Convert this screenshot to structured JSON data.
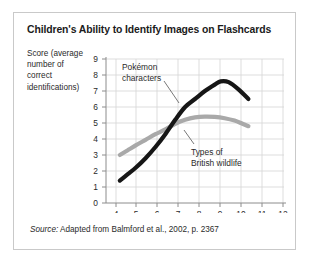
{
  "figure": {
    "title": "Children's Ability to Identify Images on Flashcards",
    "y_axis_title": "Score (average number of correct identifications)",
    "source_label": "Source:",
    "source_text": " Adapted from Balmford et al., 2002, p. 2367"
  },
  "colors": {
    "pokemon_line": "#161616",
    "wildlife_line": "#a9a9a9",
    "grid": "#d4d4d4",
    "axis": "#8c8c8c",
    "text": "#2a2a2a",
    "title_text": "#1b1b1b",
    "card_border": "#c9c9c9",
    "background": "#ffffff"
  },
  "chart_data": {
    "type": "line",
    "title": "Children's Ability to Identify Images on Flashcards",
    "xlabel": "Age (in years)",
    "ylabel": "Score (average number of correct identifications)",
    "xlim": [
      3.5,
      12.5
    ],
    "ylim": [
      0,
      9
    ],
    "xticks": [
      4,
      5,
      6,
      7,
      8,
      9,
      10,
      11,
      12
    ],
    "yticks": [
      0,
      1,
      2,
      3,
      4,
      5,
      6,
      7,
      8,
      9
    ],
    "xtick_labels": [
      "4",
      "5",
      "6",
      "7",
      "8",
      "9",
      "10",
      "11",
      "12"
    ],
    "ytick_labels": [
      "0",
      "1",
      "2",
      "3",
      "4",
      "5",
      "6",
      "7",
      "8",
      "9"
    ],
    "grid": true,
    "legend": "annotations",
    "series": [
      {
        "name": "Pokémon characters",
        "color": "#161616",
        "x": [
          4.2,
          4.6,
          5.0,
          5.5,
          6.0,
          6.5,
          7.0,
          7.5,
          8.0,
          8.5,
          9.0,
          9.3,
          9.7,
          10.2,
          10.7
        ],
        "y": [
          1.4,
          1.8,
          2.2,
          2.8,
          3.5,
          4.3,
          5.2,
          6.0,
          6.5,
          7.0,
          7.4,
          7.6,
          7.55,
          7.1,
          6.5
        ]
      },
      {
        "name": "Types of British wildlife",
        "color": "#a9a9a9",
        "x": [
          4.2,
          4.6,
          5.0,
          5.5,
          6.0,
          6.5,
          7.0,
          7.5,
          8.0,
          8.5,
          9.0,
          9.5,
          10.0,
          10.4,
          10.7
        ],
        "y": [
          3.0,
          3.3,
          3.6,
          3.95,
          4.3,
          4.6,
          4.95,
          5.2,
          5.35,
          5.4,
          5.38,
          5.3,
          5.15,
          4.95,
          4.8
        ]
      }
    ],
    "annotations": [
      {
        "text_line_1": "Pokémon",
        "text_line_2": "characters",
        "target_series": "Pokémon characters"
      },
      {
        "text_line_1": "Types of",
        "text_line_2": "British wildlife",
        "target_series": "Types of British wildlife"
      }
    ]
  }
}
